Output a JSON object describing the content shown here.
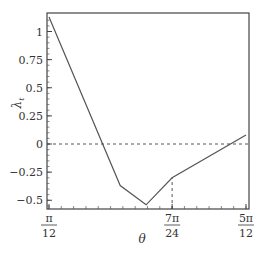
{
  "chart_data": {
    "type": "line",
    "title": "",
    "xlabel": "θ",
    "ylabel": "λ_t",
    "xlim": [
      0.2618,
      1.309
    ],
    "ylim": [
      -0.58,
      1.17
    ],
    "grid": false,
    "legend": null,
    "x_ticks": [
      {
        "value": 0.2618,
        "num": "π",
        "den": "12"
      },
      {
        "value": 0.9163,
        "num": "7π",
        "den": "24"
      },
      {
        "value": 1.309,
        "num": "5π",
        "den": "12"
      }
    ],
    "y_ticks": [
      {
        "value": 1,
        "label": "1"
      },
      {
        "value": 0.75,
        "label": "0.75"
      },
      {
        "value": 0.5,
        "label": "0.5"
      },
      {
        "value": 0.25,
        "label": "0.25"
      },
      {
        "value": 0,
        "label": "0"
      },
      {
        "value": -0.25,
        "label": "−0.25"
      },
      {
        "value": -0.5,
        "label": "−0.5"
      }
    ],
    "series": [
      {
        "name": "λ_t",
        "x": [
          0.2618,
          0.6405,
          0.7782,
          0.9163,
          1.309
        ],
        "y": [
          1.13,
          -0.37,
          -0.54,
          -0.3,
          0.08
        ]
      }
    ],
    "annotations": [
      {
        "type": "hline",
        "y": 0,
        "style": "dashed"
      },
      {
        "type": "vline",
        "x": 0.9163,
        "from_y": -0.58,
        "to_y": -0.3,
        "style": "dashed"
      }
    ]
  }
}
